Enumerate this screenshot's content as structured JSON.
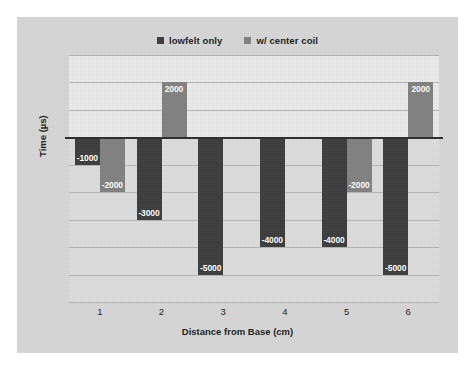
{
  "chart_data": {
    "type": "bar",
    "title": "",
    "subtitle": "",
    "xlabel": "Distance from Base (cm)",
    "ylabel": "Time (µs)",
    "categories": [
      "1",
      "2",
      "3",
      "4",
      "5",
      "6"
    ],
    "series": [
      {
        "name": "lowfelt only",
        "color": "#3b3b3b",
        "values": [
          -1000,
          -3000,
          -5000,
          -4000,
          -4000,
          -5000
        ],
        "labels": [
          "-1000",
          "-3000",
          "-5000",
          "-4000",
          "-4000",
          "-5000"
        ]
      },
      {
        "name": "w/ center coil",
        "color": "#808080",
        "values": [
          -2000,
          2000,
          0,
          0,
          -2000,
          2000
        ],
        "labels": [
          "-2000",
          "2000",
          "",
          "",
          "-2000",
          "2000"
        ]
      }
    ],
    "ylim": [
      -6000,
      3000
    ],
    "y_gridline_values": [
      3000,
      2000,
      1000,
      0,
      -1000,
      -2000,
      -3000,
      -4000,
      -5000,
      -6000
    ],
    "y_tick_labels_visible": false,
    "grid": true,
    "legend_position": "top-center",
    "zero_line": 0
  },
  "legend": {
    "entries": [
      {
        "label": "lowfelt only",
        "swatch": "#3b3b3b",
        "icon": "square-marker-icon"
      },
      {
        "label": "w/ center coil",
        "swatch": "#808080",
        "icon": "square-marker-icon"
      }
    ]
  },
  "axes": {
    "y_title": "Time (µs)",
    "x_title": "Distance from Base (cm)",
    "x_ticks": [
      "1",
      "2",
      "3",
      "4",
      "5",
      "6"
    ]
  },
  "colors": {
    "plot_background_upper": "#eaeaea",
    "plot_background_lower": "#dcdcdc",
    "figure_background": "#d6d6d6",
    "page_background": "#ffffff",
    "gridline": "#b4b4b4",
    "zero_line": "#2b2b2b",
    "series_1": "#3b3b3b",
    "series_2": "#808080",
    "label_text": "#ffffff",
    "axis_text": "#1a1a1a"
  }
}
